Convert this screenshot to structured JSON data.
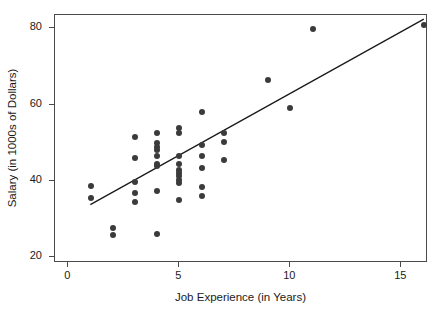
{
  "chart_data": {
    "type": "scatter",
    "title": "",
    "xlabel": "Job Experience (in Years)",
    "ylabel": "Salary (in 1000s of Dollars)",
    "xlim": [
      -0.6,
      16.2
    ],
    "ylim": [
      18.5,
      83.5
    ],
    "xticks": [
      0,
      5,
      10,
      15
    ],
    "xtick_labels": [
      "0",
      "5",
      "10",
      "15"
    ],
    "yticks": [
      20,
      40,
      60,
      80
    ],
    "ytick_labels": [
      "20",
      "40",
      "60",
      "80"
    ],
    "grid": false,
    "legend": false,
    "marker_color": "#3b3b3b",
    "line_color": "#1a1a1a",
    "frame_color": "#4a4a4a",
    "points": [
      {
        "x": 1,
        "y": 38.7
      },
      {
        "x": 1,
        "y": 35.5
      },
      {
        "x": 2,
        "y": 27.8
      },
      {
        "x": 2,
        "y": 25.8
      },
      {
        "x": 3,
        "y": 51.5
      },
      {
        "x": 3,
        "y": 46.0
      },
      {
        "x": 3,
        "y": 39.8
      },
      {
        "x": 3,
        "y": 36.8
      },
      {
        "x": 3,
        "y": 34.5
      },
      {
        "x": 4,
        "y": 52.5
      },
      {
        "x": 4,
        "y": 50.0
      },
      {
        "x": 4,
        "y": 49.0
      },
      {
        "x": 4,
        "y": 48.0
      },
      {
        "x": 4,
        "y": 46.5
      },
      {
        "x": 4,
        "y": 44.5
      },
      {
        "x": 4,
        "y": 43.8
      },
      {
        "x": 4,
        "y": 37.5
      },
      {
        "x": 4,
        "y": 26.0
      },
      {
        "x": 5,
        "y": 54.0
      },
      {
        "x": 5,
        "y": 52.5
      },
      {
        "x": 5,
        "y": 46.5
      },
      {
        "x": 5,
        "y": 44.5
      },
      {
        "x": 5,
        "y": 43.0
      },
      {
        "x": 5,
        "y": 42.0
      },
      {
        "x": 5,
        "y": 41.2
      },
      {
        "x": 5,
        "y": 40.3
      },
      {
        "x": 5,
        "y": 39.5
      },
      {
        "x": 5,
        "y": 35.0
      },
      {
        "x": 6,
        "y": 58.0
      },
      {
        "x": 6,
        "y": 49.5
      },
      {
        "x": 6,
        "y": 46.5
      },
      {
        "x": 6,
        "y": 43.5
      },
      {
        "x": 6,
        "y": 38.5
      },
      {
        "x": 6,
        "y": 36.0
      },
      {
        "x": 7,
        "y": 52.5
      },
      {
        "x": 7,
        "y": 50.3
      },
      {
        "x": 7,
        "y": 45.5
      },
      {
        "x": 9,
        "y": 66.5
      },
      {
        "x": 10,
        "y": 59.0
      },
      {
        "x": 11,
        "y": 79.7
      },
      {
        "x": 16,
        "y": 81.0
      }
    ],
    "trendline": {
      "label": "linear fit",
      "x_start": 1.0,
      "y_start": 33.4,
      "x_end": 16.1,
      "y_end": 82.4
    }
  }
}
